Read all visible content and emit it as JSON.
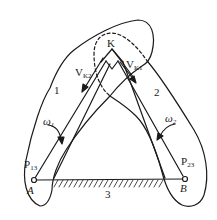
{
  "figure": {
    "type": "instant-center mechanism diagram",
    "stroke_color": "#1a1a1a",
    "background": "#ffffff"
  },
  "labels": {
    "contact_point": "K",
    "velocity_k2": {
      "main": "V",
      "sub": "K2"
    },
    "velocity_k1": {
      "main": "V",
      "sub": "K1"
    },
    "link_1": "1",
    "link_2": "2",
    "link_3": "3",
    "omega_1": {
      "main": "ω",
      "sub": "1"
    },
    "omega_2": {
      "main": "ω",
      "sub": "2"
    },
    "pole_13": {
      "main": "P",
      "sub": "13"
    },
    "pole_23": {
      "main": "P",
      "sub": "23"
    },
    "pivot_a": "A",
    "pivot_b": "B"
  }
}
